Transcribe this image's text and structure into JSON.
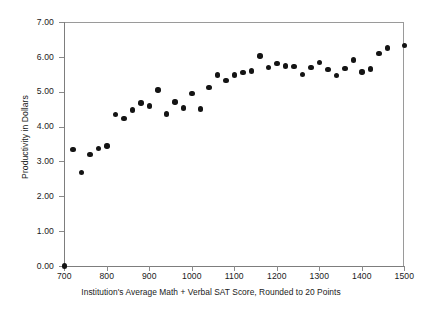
{
  "chart_data": {
    "type": "scatter",
    "title": "",
    "xlabel": "Institution's Average Math + Verbal SAT Score, Rounded to 20 Points",
    "ylabel": "Productivity in Dollars",
    "xlim": [
      700,
      1500
    ],
    "ylim": [
      0.0,
      7.0
    ],
    "xticks": [
      700,
      800,
      900,
      1000,
      1100,
      1200,
      1300,
      1400,
      1500
    ],
    "xtick_labels": [
      "700",
      "800",
      "900",
      "1000",
      "1100",
      "1200",
      "1300",
      "1400",
      "1500"
    ],
    "yticks": [
      0.0,
      1.0,
      2.0,
      3.0,
      4.0,
      5.0,
      6.0,
      7.0
    ],
    "ytick_labels": [
      "0.00",
      "1.00",
      "2.00",
      "3.00",
      "4.00",
      "5.00",
      "6.00",
      "7.00"
    ],
    "grid": false,
    "legend": null,
    "marker_color": "#141414",
    "marker_shape": "circle",
    "axis_color": "#8a8a8a",
    "background_color": "#ffffff",
    "series": [
      {
        "name": "Productivity",
        "points": [
          [
            700,
            0.0
          ],
          [
            720,
            3.34
          ],
          [
            740,
            2.68
          ],
          [
            760,
            3.2
          ],
          [
            780,
            3.37
          ],
          [
            800,
            3.44
          ],
          [
            820,
            4.34
          ],
          [
            840,
            4.23
          ],
          [
            860,
            4.48
          ],
          [
            880,
            4.68
          ],
          [
            900,
            4.59
          ],
          [
            920,
            5.05
          ],
          [
            940,
            4.36
          ],
          [
            960,
            4.71
          ],
          [
            980,
            4.53
          ],
          [
            1000,
            4.95
          ],
          [
            1020,
            4.5
          ],
          [
            1040,
            5.12
          ],
          [
            1060,
            5.48
          ],
          [
            1080,
            5.32
          ],
          [
            1100,
            5.48
          ],
          [
            1120,
            5.56
          ],
          [
            1140,
            5.59
          ],
          [
            1160,
            6.02
          ],
          [
            1180,
            5.69
          ],
          [
            1200,
            5.81
          ],
          [
            1220,
            5.74
          ],
          [
            1240,
            5.73
          ],
          [
            1260,
            5.49
          ],
          [
            1280,
            5.7
          ],
          [
            1300,
            5.83
          ],
          [
            1320,
            5.64
          ],
          [
            1340,
            5.47
          ],
          [
            1360,
            5.67
          ],
          [
            1380,
            5.91
          ],
          [
            1400,
            5.57
          ],
          [
            1420,
            5.65
          ],
          [
            1440,
            6.1
          ],
          [
            1460,
            6.25
          ],
          [
            1500,
            6.33
          ]
        ]
      }
    ]
  }
}
